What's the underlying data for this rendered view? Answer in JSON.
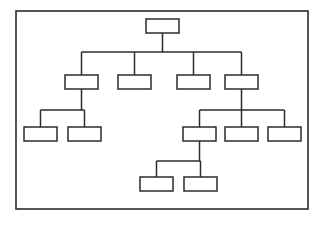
{
  "diagram": {
    "title": "",
    "type": "organizational-tree-chart",
    "style": {
      "background_color": "#ffffff",
      "line_color": "#2b2b2b",
      "node_fill_color": "#ffffff",
      "node_stroke_color": "#2b2b2b"
    },
    "frame": {
      "name": "outer-border",
      "x": 16,
      "y": 11,
      "width": 292,
      "height": 198
    },
    "node_size": {
      "width": 33,
      "height": 14
    },
    "nodes": [
      {
        "id": "n0",
        "label": "",
        "level": 0,
        "x": 146,
        "y": 19,
        "w": 33,
        "h": 14
      },
      {
        "id": "n1",
        "label": "",
        "level": 1,
        "x": 65,
        "y": 75,
        "w": 33,
        "h": 14
      },
      {
        "id": "n2",
        "label": "",
        "level": 1,
        "x": 118,
        "y": 75,
        "w": 33,
        "h": 14
      },
      {
        "id": "n3",
        "label": "",
        "level": 1,
        "x": 177,
        "y": 75,
        "w": 33,
        "h": 14
      },
      {
        "id": "n4",
        "label": "",
        "level": 1,
        "x": 225,
        "y": 75,
        "w": 33,
        "h": 14
      },
      {
        "id": "n5",
        "label": "",
        "level": 2,
        "x": 24,
        "y": 127,
        "w": 33,
        "h": 14
      },
      {
        "id": "n6",
        "label": "",
        "level": 2,
        "x": 68,
        "y": 127,
        "w": 33,
        "h": 14
      },
      {
        "id": "n7",
        "label": "",
        "level": 2,
        "x": 183,
        "y": 127,
        "w": 33,
        "h": 14
      },
      {
        "id": "n8",
        "label": "",
        "level": 2,
        "x": 225,
        "y": 127,
        "w": 33,
        "h": 14
      },
      {
        "id": "n9",
        "label": "",
        "level": 2,
        "x": 268,
        "y": 127,
        "w": 33,
        "h": 14
      },
      {
        "id": "n10",
        "label": "",
        "level": 3,
        "x": 140,
        "y": 177,
        "w": 33,
        "h": 14
      },
      {
        "id": "n11",
        "label": "",
        "level": 3,
        "x": 184,
        "y": 177,
        "w": 33,
        "h": 14
      }
    ],
    "edges": [
      {
        "from": "n0",
        "to": "n1"
      },
      {
        "from": "n0",
        "to": "n2"
      },
      {
        "from": "n0",
        "to": "n3"
      },
      {
        "from": "n0",
        "to": "n4"
      },
      {
        "from": "n1",
        "to": "n5"
      },
      {
        "from": "n1",
        "to": "n6"
      },
      {
        "from": "n4",
        "to": "n7"
      },
      {
        "from": "n4",
        "to": "n8"
      },
      {
        "from": "n4",
        "to": "n9"
      },
      {
        "from": "n7",
        "to": "n10"
      },
      {
        "from": "n7",
        "to": "n11"
      }
    ],
    "connectors": [
      {
        "name": "root-stem",
        "x1": 162.5,
        "y1": 33,
        "x2": 162.5,
        "y2": 52
      },
      {
        "name": "level1-bus",
        "x1": 81.5,
        "y1": 52,
        "x2": 241.5,
        "y2": 52
      },
      {
        "name": "drop-to-n1",
        "x1": 81.5,
        "y1": 52,
        "x2": 81.5,
        "y2": 75
      },
      {
        "name": "drop-to-n2",
        "x1": 134.5,
        "y1": 52,
        "x2": 134.5,
        "y2": 75
      },
      {
        "name": "drop-to-n3",
        "x1": 193.5,
        "y1": 52,
        "x2": 193.5,
        "y2": 75
      },
      {
        "name": "drop-to-n4",
        "x1": 241.5,
        "y1": 52,
        "x2": 241.5,
        "y2": 75
      },
      {
        "name": "n1-stem",
        "x1": 81.5,
        "y1": 89,
        "x2": 81.5,
        "y2": 110
      },
      {
        "name": "n1-children-bus",
        "x1": 40.5,
        "y1": 110,
        "x2": 84.5,
        "y2": 110
      },
      {
        "name": "drop-to-n5",
        "x1": 40.5,
        "y1": 110,
        "x2": 40.5,
        "y2": 127
      },
      {
        "name": "drop-to-n6",
        "x1": 84.5,
        "y1": 110,
        "x2": 84.5,
        "y2": 127
      },
      {
        "name": "n4-stem",
        "x1": 241.5,
        "y1": 89,
        "x2": 241.5,
        "y2": 110
      },
      {
        "name": "n4-children-bus",
        "x1": 199.5,
        "y1": 110,
        "x2": 284.5,
        "y2": 110
      },
      {
        "name": "drop-to-n7",
        "x1": 199.5,
        "y1": 110,
        "x2": 199.5,
        "y2": 127
      },
      {
        "name": "drop-to-n8",
        "x1": 241.5,
        "y1": 110,
        "x2": 241.5,
        "y2": 127
      },
      {
        "name": "drop-to-n9",
        "x1": 284.5,
        "y1": 110,
        "x2": 284.5,
        "y2": 127
      },
      {
        "name": "n7-stem",
        "x1": 199.5,
        "y1": 141,
        "x2": 199.5,
        "y2": 161
      },
      {
        "name": "n7-children-bus",
        "x1": 156.5,
        "y1": 161,
        "x2": 200.5,
        "y2": 161
      },
      {
        "name": "drop-to-n10",
        "x1": 156.5,
        "y1": 161,
        "x2": 156.5,
        "y2": 177
      },
      {
        "name": "drop-to-n11",
        "x1": 200.5,
        "y1": 161,
        "x2": 200.5,
        "y2": 177
      }
    ],
    "counts": {
      "total_nodes": 12,
      "levels": 4,
      "level_0_nodes": 1,
      "level_1_nodes": 4,
      "level_2_nodes": 5,
      "level_3_nodes": 2
    }
  }
}
